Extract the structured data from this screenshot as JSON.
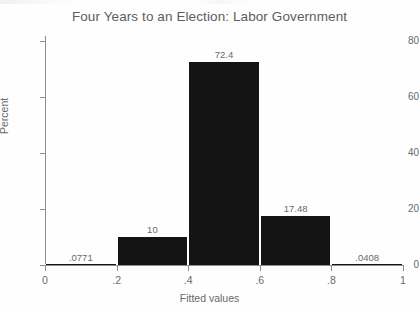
{
  "chart_data": {
    "type": "bar",
    "title": "Four Years to an Election: Labor Government",
    "xlabel": "Fitted values",
    "ylabel": "Percent",
    "xlim": [
      0,
      1
    ],
    "ylim": [
      0,
      80
    ],
    "grid": false,
    "legend": null,
    "bin_width": 0.2,
    "bin_edges": [
      0,
      0.2,
      0.4,
      0.6,
      0.8,
      1
    ],
    "categories": [
      "0–.2",
      ".2–.4",
      ".4–.6",
      ".6–.8",
      ".8–1"
    ],
    "bin_centers": [
      0.1,
      0.3,
      0.5,
      0.7,
      0.9
    ],
    "values": [
      0.0771,
      10,
      72.4,
      17.48,
      0.0408
    ],
    "data_labels": [
      ".0771",
      "10",
      "72.4",
      "17.48",
      ".0408"
    ],
    "bar_color": "#141414",
    "xticks": [
      0,
      0.2,
      0.4,
      0.6,
      0.8,
      1
    ],
    "xtick_labels": [
      "0",
      ".2",
      ".4",
      ".6",
      ".8",
      "1"
    ],
    "yticks": [
      0,
      20,
      40,
      60,
      80
    ],
    "ytick_labels": [
      "0",
      "20",
      "40",
      "60",
      "80"
    ]
  },
  "colors": {
    "bar": "#141414",
    "axis": "#8d8d8d",
    "text": "#6a6a6a",
    "title": "#5d5d5d",
    "background": "#fefefe"
  }
}
